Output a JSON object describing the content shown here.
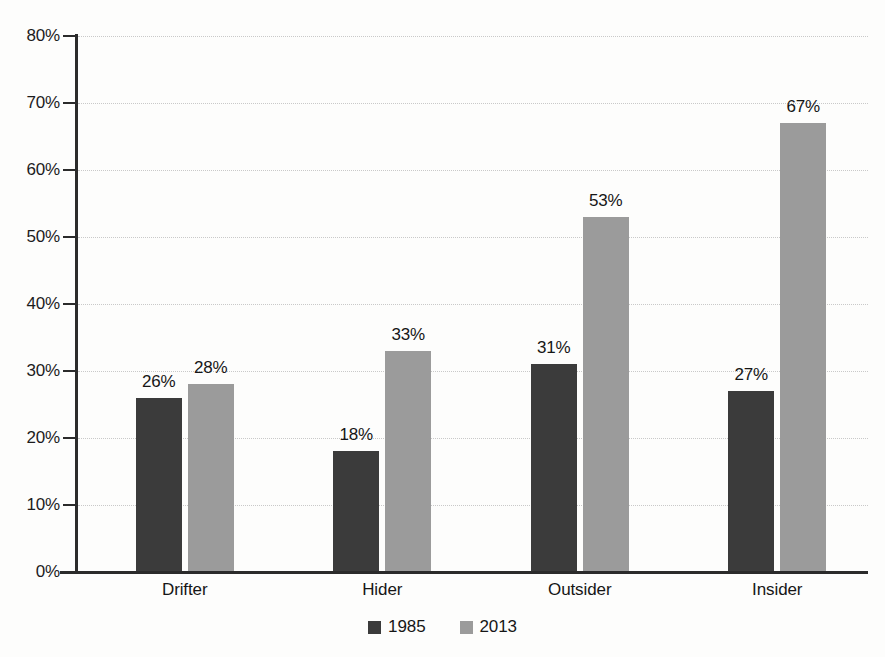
{
  "chart_data": {
    "type": "bar",
    "title": "",
    "subtitle": "",
    "xlabel": "",
    "ylabel": "",
    "categories": [
      "Drifter",
      "Hider",
      "Outsider",
      "Insider"
    ],
    "series": [
      {
        "name": "1985",
        "color": "#3b3b3b",
        "values": [
          26,
          18,
          31,
          27
        ],
        "labels": [
          "26%",
          "18%",
          "31%",
          "27%"
        ]
      },
      {
        "name": "2013",
        "color": "#9b9b9b",
        "values": [
          28,
          33,
          53,
          67
        ],
        "labels": [
          "28%",
          "33%",
          "53%",
          "67%"
        ]
      }
    ],
    "ylim": [
      0,
      80
    ],
    "ytick_values": [
      0,
      10,
      20,
      30,
      40,
      50,
      60,
      70,
      80
    ],
    "ytick_labels": [
      "0%",
      "10%",
      "20%",
      "30%",
      "40%",
      "50%",
      "60%",
      "70%",
      "80%"
    ],
    "value_suffix": "%",
    "grid": {
      "horizontal": true,
      "vertical": false,
      "style": "dotted",
      "color": "#c9c9c9"
    },
    "legend": {
      "position": "bottom-center",
      "entries": [
        {
          "label": "1985",
          "color": "#3b3b3b"
        },
        {
          "label": "2013",
          "color": "#9b9b9b"
        }
      ]
    },
    "axis_color": "#2b2b2b",
    "background": "#fdfdfc"
  }
}
